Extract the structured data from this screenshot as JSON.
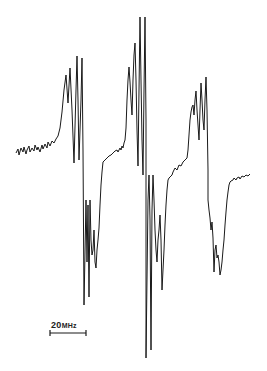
{
  "figure": {
    "type": "EPR spectrum trace",
    "scale_bar": {
      "value": "20",
      "unit": "MHz",
      "label": "20MHz"
    },
    "line_color": "#1a1a1a",
    "groups": [
      {
        "name": "low-field group",
        "peak_count": 4,
        "trough_count": 4
      },
      {
        "name": "center group",
        "peak_count": 4,
        "trough_count": 4
      },
      {
        "name": "high-field group",
        "peak_count": 4,
        "trough_count": 4
      }
    ]
  }
}
